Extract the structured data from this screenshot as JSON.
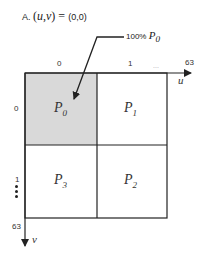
{
  "title": {
    "prefix": "A.",
    "open_paren": "(",
    "var_u": "u",
    "comma": ",",
    "var_v": "v",
    "close_paren": ")",
    "equals": " = ",
    "value": "(0,0)"
  },
  "callout": {
    "percent": "100%",
    "target_base": "P",
    "target_sub": "0"
  },
  "u_axis": {
    "label": "u",
    "ticks": [
      "0",
      "1",
      "...",
      "63"
    ]
  },
  "v_axis": {
    "label": "v",
    "ticks": [
      "0",
      "1",
      "63"
    ]
  },
  "cells": [
    {
      "base": "P",
      "sub": "0",
      "highlighted": true
    },
    {
      "base": "P",
      "sub": "1",
      "highlighted": false
    },
    {
      "base": "P",
      "sub": "3",
      "highlighted": false
    },
    {
      "base": "P",
      "sub": "2",
      "highlighted": false
    }
  ],
  "colors": {
    "highlight_fill": "#d9d9d9",
    "line": "#222222"
  }
}
